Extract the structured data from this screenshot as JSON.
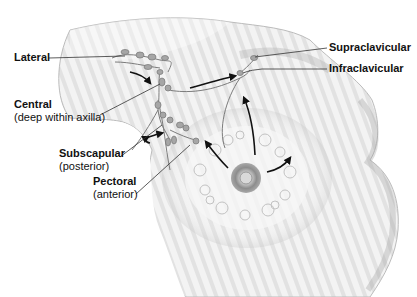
{
  "diagram": {
    "labels": [
      {
        "id": "lateral",
        "name": "Lateral",
        "note": ""
      },
      {
        "id": "central",
        "name": "Central",
        "note": "(deep within axilla)"
      },
      {
        "id": "subscapular",
        "name": "Subscapular",
        "note": "(posterior)"
      },
      {
        "id": "pectoral",
        "name": "Pectoral",
        "note": "(anterior)"
      },
      {
        "id": "supraclavicular",
        "name": "Supraclavicular",
        "note": ""
      },
      {
        "id": "infraclavicular",
        "name": "Infraclavicular",
        "note": ""
      }
    ],
    "colors": {
      "background": "#ffffff",
      "skin_light": "#f2f2f2",
      "skin_shade": "#c8c8c8",
      "outline": "#8a8a8a",
      "node": "#a8a8a8",
      "arrow": "#111111",
      "leader_line": "#333333",
      "text": "#111111"
    }
  }
}
